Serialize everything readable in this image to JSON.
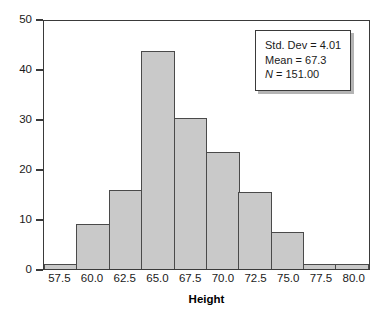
{
  "chart_data": {
    "type": "bar",
    "title": "",
    "subtitle": "",
    "xlabel": "Height",
    "ylabel": "",
    "categories": [
      "57.5",
      "60.0",
      "62.5",
      "65.0",
      "67.5",
      "70.0",
      "72.5",
      "75.0",
      "77.5",
      "80.0"
    ],
    "values": [
      1,
      9,
      16,
      44,
      30.5,
      23.5,
      15.5,
      7.5,
      1,
      1
    ],
    "xlim": [
      56.25,
      81.25
    ],
    "ylim": [
      0,
      50
    ],
    "yticks": [
      "0",
      "10",
      "20",
      "30",
      "40",
      "50"
    ],
    "ytick_values": [
      0,
      10,
      20,
      30,
      40,
      50
    ],
    "xticks": [
      "57.5",
      "60.0",
      "62.5",
      "65.0",
      "67.5",
      "70.0",
      "72.5",
      "75.0",
      "77.5",
      "80.0"
    ],
    "grid": false,
    "legend_position": "upper-right",
    "bin_width": 2.5,
    "bar_fill_color": "#c9c9c9",
    "bar_border_color": "#4a4a4a",
    "frame_color": "#3a3a3a",
    "annotations": [
      "Std. Dev = 4.01",
      "Mean = 67.3",
      "N = 151.00"
    ]
  },
  "stats_box": {
    "std_dev_label": "Std. Dev = ",
    "std_dev_value": "4.01",
    "mean_label": "Mean = ",
    "mean_value": "67.3",
    "n_symbol": "N",
    "n_label": " = ",
    "n_value": "151.00"
  },
  "axis": {
    "x_title": "Height"
  }
}
